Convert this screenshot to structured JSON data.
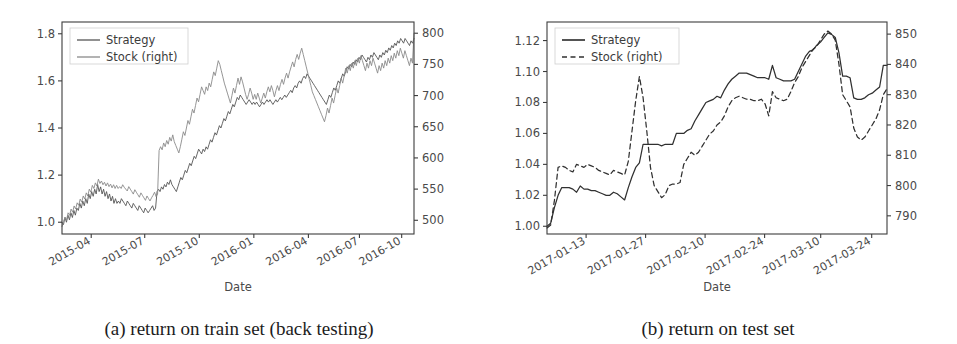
{
  "figure": {
    "panels": [
      {
        "id": "a",
        "caption": "(a) return on train set (back testing)",
        "chart_data": {
          "type": "line",
          "title": "",
          "xlabel": "Date",
          "ylabel": "",
          "grid": false,
          "legend_position": "upper left",
          "left_axis": {
            "ticks": [
              "1.0",
              "1.2",
              "1.4",
              "1.6",
              "1.8"
            ],
            "tickvals": [
              1.0,
              1.2,
              1.4,
              1.6,
              1.8
            ],
            "ylim": [
              0.95,
              1.85
            ]
          },
          "right_axis": {
            "ticks": [
              "500",
              "550",
              "600",
              "650",
              "700",
              "750",
              "800"
            ],
            "tickvals": [
              500,
              550,
              600,
              650,
              700,
              750,
              800
            ],
            "ylim": [
              478,
              818
            ]
          },
          "xticks": [
            "2015-04",
            "2015-07",
            "2015-10",
            "2016-01",
            "2016-04",
            "2016-07",
            "2016-10"
          ],
          "xtickpos": [
            0.083,
            0.235,
            0.39,
            0.545,
            0.7,
            0.845,
            0.965
          ],
          "xlim_labels": [
            "2015-02",
            "2016-12"
          ],
          "series": [
            {
              "name": "Strategy",
              "axis": "left",
              "color": "#555555",
              "dash": "none",
              "values": [
                1.0,
                0.99,
                1.02,
                1.0,
                1.03,
                1.01,
                1.04,
                1.02,
                1.05,
                1.03,
                1.06,
                1.05,
                1.08,
                1.06,
                1.09,
                1.07,
                1.1,
                1.08,
                1.12,
                1.1,
                1.13,
                1.11,
                1.14,
                1.12,
                1.16,
                1.13,
                1.15,
                1.12,
                1.14,
                1.11,
                1.13,
                1.1,
                1.12,
                1.09,
                1.11,
                1.08,
                1.1,
                1.08,
                1.09,
                1.08,
                1.1,
                1.09,
                1.08,
                1.07,
                1.09,
                1.08,
                1.07,
                1.06,
                1.08,
                1.07,
                1.06,
                1.05,
                1.07,
                1.06,
                1.05,
                1.04,
                1.06,
                1.05,
                1.04,
                1.05,
                1.06,
                1.07,
                1.05,
                1.06,
                1.13,
                1.14,
                1.13,
                1.15,
                1.14,
                1.16,
                1.15,
                1.17,
                1.16,
                1.18,
                1.16,
                1.15,
                1.14,
                1.13,
                1.15,
                1.17,
                1.19,
                1.18,
                1.2,
                1.22,
                1.21,
                1.23,
                1.25,
                1.24,
                1.26,
                1.28,
                1.27,
                1.29,
                1.31,
                1.3,
                1.29,
                1.31,
                1.3,
                1.32,
                1.31,
                1.33,
                1.35,
                1.34,
                1.36,
                1.38,
                1.37,
                1.39,
                1.41,
                1.4,
                1.42,
                1.44,
                1.43,
                1.45,
                1.47,
                1.46,
                1.48,
                1.5,
                1.49,
                1.51,
                1.53,
                1.52,
                1.54,
                1.53,
                1.52,
                1.51,
                1.5,
                1.51,
                1.52,
                1.51,
                1.5,
                1.51,
                1.5,
                1.51,
                1.5,
                1.49,
                1.5,
                1.51,
                1.5,
                1.51,
                1.52,
                1.51,
                1.52,
                1.51,
                1.5,
                1.51,
                1.52,
                1.51,
                1.52,
                1.53,
                1.52,
                1.53,
                1.54,
                1.53,
                1.54,
                1.55,
                1.56,
                1.55,
                1.57,
                1.58,
                1.57,
                1.59,
                1.6,
                1.59,
                1.61,
                1.62,
                1.61,
                1.63,
                1.62,
                1.61,
                1.6,
                1.59,
                1.58,
                1.57,
                1.56,
                1.55,
                1.54,
                1.53,
                1.52,
                1.51,
                1.5,
                1.52,
                1.54,
                1.53,
                1.55,
                1.57,
                1.56,
                1.58,
                1.6,
                1.59,
                1.61,
                1.63,
                1.62,
                1.64,
                1.66,
                1.65,
                1.67,
                1.66,
                1.68,
                1.67,
                1.69,
                1.68,
                1.7,
                1.69,
                1.71,
                1.7,
                1.69,
                1.68,
                1.7,
                1.69,
                1.71,
                1.7,
                1.72,
                1.71,
                1.7,
                1.69,
                1.71,
                1.7,
                1.72,
                1.71,
                1.73,
                1.72,
                1.74,
                1.73,
                1.75,
                1.74,
                1.76,
                1.75,
                1.77,
                1.76,
                1.78,
                1.77,
                1.76,
                1.78,
                1.77,
                1.76,
                1.75,
                1.77,
                1.76,
                1.78
              ]
            },
            {
              "name": "Stock (right)",
              "axis": "right",
              "color": "#8a8a8a",
              "dash": "none",
              "values": [
                490,
                498,
                505,
                500,
                512,
                508,
                518,
                513,
                523,
                518,
                528,
                524,
                534,
                529,
                539,
                534,
                544,
                539,
                550,
                545,
                556,
                551,
                560,
                555,
                566,
                559,
                563,
                557,
                561,
                555,
                560,
                554,
                558,
                552,
                557,
                551,
                556,
                551,
                554,
                551,
                557,
                553,
                550,
                547,
                554,
                550,
                546,
                542,
                549,
                545,
                541,
                537,
                544,
                540,
                536,
                532,
                539,
                535,
                531,
                536,
                540,
                545,
                538,
                542,
                612,
                618,
                613,
                624,
                618,
                628,
                622,
                633,
                627,
                637,
                626,
                620,
                614,
                608,
                618,
                630,
                642,
                636,
                648,
                660,
                654,
                666,
                678,
                672,
                684,
                696,
                690,
                702,
                714,
                708,
                702,
                714,
                708,
                720,
                714,
                726,
                738,
                732,
                744,
                756,
                750,
                740,
                730,
                720,
                712,
                704,
                696,
                688,
                700,
                712,
                704,
                716,
                728,
                718,
                730,
                722,
                712,
                702,
                694,
                702,
                712,
                704,
                694,
                702,
                694,
                704,
                696,
                688,
                696,
                704,
                696,
                706,
                714,
                706,
                716,
                708,
                698,
                708,
                716,
                708,
                718,
                726,
                718,
                728,
                736,
                728,
                738,
                746,
                754,
                746,
                758,
                766,
                758,
                768,
                776,
                766,
                756,
                746,
                736,
                726,
                716,
                706,
                700,
                694,
                688,
                682,
                676,
                670,
                664,
                658,
                668,
                680,
                672,
                684,
                696,
                688,
                700,
                712,
                704,
                716,
                728,
                720,
                732,
                744,
                736,
                748,
                740,
                752,
                744,
                756,
                748,
                760,
                752,
                764,
                756,
                748,
                740,
                752,
                744,
                756,
                748,
                760,
                752,
                744,
                736,
                748,
                740,
                752,
                744,
                756,
                748,
                760,
                752,
                764,
                756,
                768,
                760,
                772,
                764,
                776,
                768,
                760,
                772,
                764,
                756,
                748,
                760,
                752,
                800
              ]
            }
          ]
        }
      },
      {
        "id": "b",
        "caption": "(b) return on test set",
        "chart_data": {
          "type": "line",
          "title": "",
          "xlabel": "Date",
          "ylabel": "",
          "grid": false,
          "legend_position": "upper left",
          "left_axis": {
            "ticks": [
              "1.00",
              "1.02",
              "1.04",
              "1.06",
              "1.08",
              "1.10",
              "1.12"
            ],
            "tickvals": [
              1.0,
              1.02,
              1.04,
              1.06,
              1.08,
              1.1,
              1.12
            ],
            "ylim": [
              0.995,
              1.132
            ]
          },
          "right_axis": {
            "ticks": [
              "790",
              "800",
              "810",
              "820",
              "830",
              "840",
              "850"
            ],
            "tickvals": [
              790,
              800,
              810,
              820,
              830,
              840,
              850
            ],
            "ylim": [
              784,
              854
            ]
          },
          "xticks": [
            "2017-01-13",
            "2017-01-27",
            "2017-02-10",
            "2017-02-24",
            "2017-03-10",
            "2017-03-24"
          ],
          "xtickpos": [
            0.115,
            0.29,
            0.465,
            0.64,
            0.805,
            0.955
          ],
          "xlim_labels": [
            "2017-01-03",
            "2017-03-31"
          ],
          "series": [
            {
              "name": "Strategy",
              "axis": "left",
              "color": "#303030",
              "dash": "none",
              "values": [
                1.0,
                1.002,
                1.012,
                1.02,
                1.025,
                1.025,
                1.025,
                1.024,
                1.022,
                1.026,
                1.024,
                1.024,
                1.023,
                1.023,
                1.022,
                1.021,
                1.02,
                1.02,
                1.022,
                1.021,
                1.019,
                1.017,
                1.025,
                1.032,
                1.038,
                1.041,
                1.053,
                1.053,
                1.053,
                1.053,
                1.053,
                1.052,
                1.053,
                1.053,
                1.053,
                1.06,
                1.06,
                1.06,
                1.062,
                1.063,
                1.068,
                1.072,
                1.076,
                1.08,
                1.081,
                1.082,
                1.084,
                1.083,
                1.088,
                1.092,
                1.095,
                1.097,
                1.099,
                1.099,
                1.099,
                1.098,
                1.097,
                1.096,
                1.096,
                1.096,
                1.095,
                1.104,
                1.096,
                1.095,
                1.094,
                1.094,
                1.094,
                1.095,
                1.1,
                1.105,
                1.11,
                1.113,
                1.114,
                1.117,
                1.119,
                1.122,
                1.125,
                1.124,
                1.122,
                1.112,
                1.097,
                1.097,
                1.096,
                1.083,
                1.082,
                1.082,
                1.083,
                1.085,
                1.086,
                1.088,
                1.09,
                1.104,
                1.104
              ]
            },
            {
              "name": "Stock (right)",
              "axis": "right",
              "color": "#303030",
              "dash": "dashed",
              "values": [
                786.0,
                787.0,
                795.0,
                806.0,
                806.5,
                806.0,
                805.0,
                804.5,
                807.0,
                806.5,
                806.0,
                807.0,
                806.5,
                806.0,
                805.0,
                804.5,
                804.0,
                803.5,
                805.0,
                804.5,
                804.0,
                803.5,
                808.0,
                818.0,
                828.0,
                836.0,
                829.0,
                818.0,
                806.0,
                800.0,
                798.0,
                796.0,
                797.0,
                800.0,
                800.5,
                800.5,
                801.0,
                807.0,
                809.0,
                811.0,
                810.0,
                811.0,
                813.0,
                815.0,
                817.0,
                818.0,
                820.0,
                821.0,
                823.0,
                826.0,
                828.0,
                829.0,
                829.5,
                829.0,
                828.5,
                828.5,
                828.0,
                828.0,
                828.5,
                827.0,
                823.0,
                831.0,
                829.0,
                828.5,
                828.0,
                828.5,
                831.0,
                834.0,
                836.0,
                839.0,
                841.0,
                843.0,
                845.0,
                846.0,
                848.0,
                850.0,
                851.0,
                850.0,
                848.0,
                840.0,
                830.0,
                828.0,
                826.0,
                819.0,
                816.0,
                815.0,
                816.0,
                818.0,
                820.0,
                822.0,
                825.0,
                830.0,
                832.0
              ]
            }
          ]
        }
      }
    ]
  }
}
